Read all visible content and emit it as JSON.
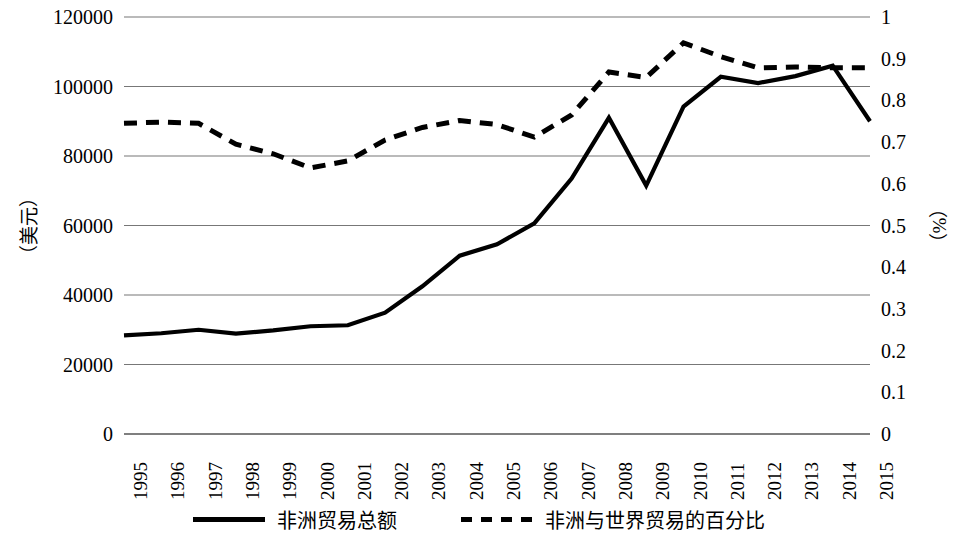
{
  "chart_data": {
    "type": "line",
    "title": "",
    "xlabel": "",
    "ylabel": "（美元）",
    "y2label": "（%）",
    "grid": true,
    "legend_position": "bottom",
    "categories": [
      "1995",
      "1996",
      "1997",
      "1998",
      "1999",
      "2000",
      "2001",
      "2002",
      "2003",
      "2004",
      "2005",
      "2006",
      "2007",
      "2008",
      "2009",
      "2010",
      "2011",
      "2012",
      "2013",
      "2014",
      "2015"
    ],
    "ylim": [
      0,
      120000
    ],
    "yticks": [
      "0",
      "20000",
      "40000",
      "60000",
      "80000",
      "100000",
      "120000"
    ],
    "y2lim": [
      0,
      1
    ],
    "y2ticks": [
      "0",
      "0.1",
      "0.2",
      "0.3",
      "0.4",
      "0.5",
      "0.6",
      "0.7",
      "0.8",
      "0.9",
      "1"
    ],
    "series": [
      {
        "name": "非洲贸易总额",
        "axis": "left",
        "style": "solid",
        "color": "#000000",
        "values": [
          28400,
          29000,
          30000,
          28900,
          29800,
          31000,
          31300,
          34900,
          42500,
          51300,
          54600,
          60600,
          73500,
          91000,
          71500,
          94200,
          102800,
          101000,
          103000,
          106000,
          90000
        ]
      },
      {
        "name": "非洲与世界贸易的百分比",
        "axis": "right",
        "style": "dashed",
        "color": "#000000",
        "values": [
          0.745,
          0.748,
          0.745,
          0.695,
          0.672,
          0.638,
          0.655,
          0.705,
          0.735,
          0.752,
          0.742,
          0.712,
          0.765,
          0.868,
          0.855,
          0.938,
          0.905,
          0.878,
          0.88,
          0.878,
          0.878
        ]
      }
    ]
  },
  "axes": {
    "left_title": "（美元）",
    "right_title": "（%）"
  },
  "legend": {
    "items": [
      {
        "label": "非洲贸易总额",
        "swatch": "solid-line-swatch"
      },
      {
        "label": "非洲与世界贸易的百分比",
        "swatch": "dashed-line-swatch"
      }
    ]
  }
}
